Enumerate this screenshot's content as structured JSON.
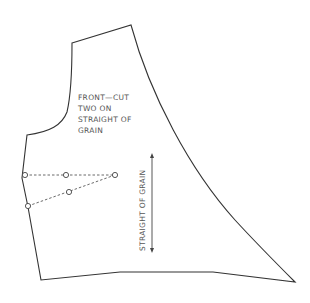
{
  "pattern": {
    "piece_label_lines": [
      "FRONT—CUT",
      "TWO ON",
      "STRAIGHT OF",
      "GRAIN"
    ],
    "grainline_label": "STRAIGHT OF GRAIN"
  },
  "colors": {
    "outline": "#333333",
    "text": "#555555",
    "background": "#ffffff"
  }
}
